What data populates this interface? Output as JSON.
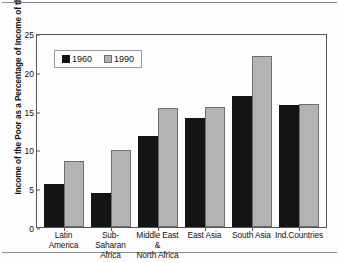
{
  "chart_data": {
    "type": "bar",
    "title": "",
    "xlabel": "",
    "ylabel": "Income of the Poor as a Percentage of Income of the Rich",
    "ylim": [
      0,
      25
    ],
    "yticks": [
      0,
      5,
      10,
      15,
      20,
      25
    ],
    "grid": false,
    "legend_position": "upper-center-left",
    "categories": [
      "Latin America",
      "Sub-Saharan Africa",
      "Middle East & North Africa",
      "East Asia",
      "South Asia",
      "Ind.Countries"
    ],
    "category_lines": [
      {
        "line1": "Latin America",
        "line2": ""
      },
      {
        "line1": "Sub-Saharan",
        "line2": "Africa"
      },
      {
        "line1": "Middle East &",
        "line2": "North Africa"
      },
      {
        "line1": "East Asia",
        "line2": ""
      },
      {
        "line1": "South Asia",
        "line2": ""
      },
      {
        "line1": "Ind.Countries",
        "line2": ""
      }
    ],
    "series": [
      {
        "name": "1960",
        "color": "#141414",
        "values": [
          5.5,
          4.4,
          11.7,
          14.1,
          16.9,
          15.7
        ]
      },
      {
        "name": "1990",
        "color": "#b3b3b3",
        "values": [
          8.5,
          9.9,
          15.3,
          15.5,
          22.0,
          15.8
        ]
      }
    ]
  },
  "legend": {
    "items": [
      {
        "label": "1960"
      },
      {
        "label": "1990"
      }
    ]
  }
}
